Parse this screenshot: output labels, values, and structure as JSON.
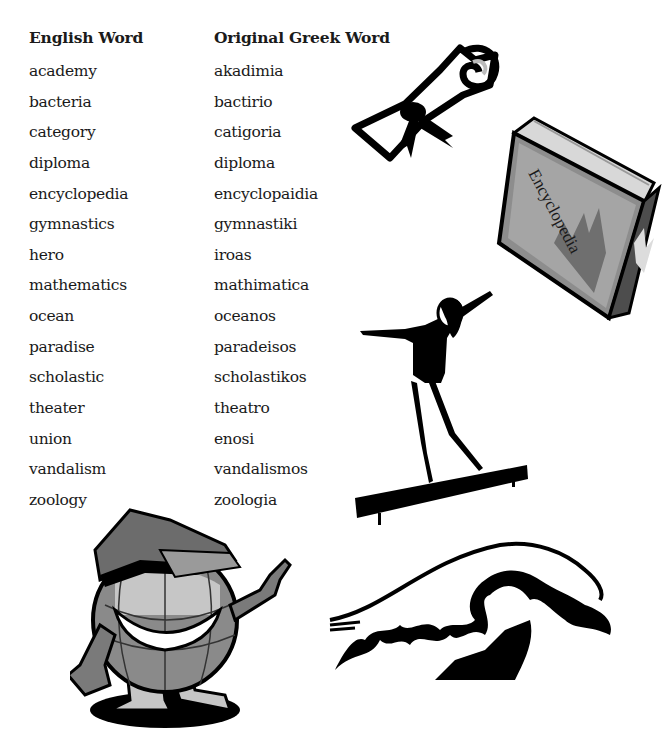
{
  "table": {
    "headers": {
      "english": "English Word",
      "greek": "Original Greek Word"
    },
    "rows": [
      {
        "english": "academy",
        "greek": "akadimia"
      },
      {
        "english": "bacteria",
        "greek": "bactirio"
      },
      {
        "english": "category",
        "greek": "catigoria"
      },
      {
        "english": "diploma",
        "greek": "diploma"
      },
      {
        "english": "encyclopedia",
        "greek": "encyclopaidia"
      },
      {
        "english": "gymnastics",
        "greek": "gymnastiki"
      },
      {
        "english": "hero",
        "greek": "iroas"
      },
      {
        "english": "mathematics",
        "greek": "mathimatica"
      },
      {
        "english": "ocean",
        "greek": "oceanos"
      },
      {
        "english": "paradise",
        "greek": "paradeisos"
      },
      {
        "english": "scholastic",
        "greek": "scholastikos"
      },
      {
        "english": "theater",
        "greek": "theatro"
      },
      {
        "english": "union",
        "greek": "enosi"
      },
      {
        "english": "vandalism",
        "greek": "vandalismos"
      },
      {
        "english": "zoology",
        "greek": "zoologia"
      }
    ]
  },
  "illustrations": {
    "diploma": "diploma-scroll-icon",
    "book": {
      "icon": "encyclopedia-book-icon",
      "spine_text": "Encyclopedia"
    },
    "gymnast": "gymnast-on-balance-beam-icon",
    "globe": "globe-mascot-pointing-icon",
    "wave": "ocean-wave-icon"
  },
  "colors": {
    "text": "#1a1a1a",
    "ink": "#000000",
    "gray_dark": "#555555",
    "gray_mid": "#8a8a8a",
    "gray_light": "#c8c8c8"
  }
}
